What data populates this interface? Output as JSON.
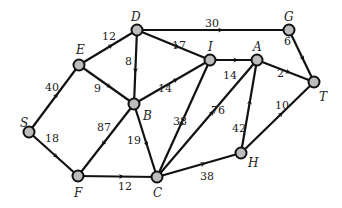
{
  "diagram": {
    "type": "directed-weighted-network",
    "nodes": [
      {
        "id": "S",
        "label": "S",
        "x": 29,
        "y": 132,
        "lx": 20,
        "ly": 127
      },
      {
        "id": "E",
        "label": "E",
        "x": 79,
        "y": 65,
        "lx": 76,
        "ly": 54
      },
      {
        "id": "D",
        "label": "D",
        "x": 137,
        "y": 30,
        "lx": 131,
        "ly": 21
      },
      {
        "id": "G",
        "label": "G",
        "x": 289,
        "y": 30,
        "lx": 284,
        "ly": 21
      },
      {
        "id": "B",
        "label": "B",
        "x": 134,
        "y": 104,
        "lx": 143,
        "ly": 120
      },
      {
        "id": "I",
        "label": "I",
        "x": 210,
        "y": 60,
        "lx": 208,
        "ly": 51
      },
      {
        "id": "A",
        "label": "A",
        "x": 257,
        "y": 60,
        "lx": 253,
        "ly": 51
      },
      {
        "id": "T",
        "label": "T",
        "x": 314,
        "y": 82,
        "lx": 319,
        "ly": 101
      },
      {
        "id": "F",
        "label": "F",
        "x": 78,
        "y": 176,
        "lx": 74,
        "ly": 197
      },
      {
        "id": "C",
        "label": "C",
        "x": 157,
        "y": 177,
        "lx": 153,
        "ly": 197
      },
      {
        "id": "H",
        "label": "H",
        "x": 241,
        "y": 153,
        "lx": 248,
        "ly": 167
      }
    ],
    "edges": [
      {
        "from": "S",
        "to": "E",
        "weight": "40",
        "lx": 45,
        "ly": 91
      },
      {
        "from": "S",
        "to": "F",
        "weight": "18",
        "lx": 45,
        "ly": 142
      },
      {
        "from": "E",
        "to": "D",
        "weight": "12",
        "lx": 102,
        "ly": 40
      },
      {
        "from": "E",
        "to": "B",
        "weight": "9",
        "lx": 94,
        "ly": 92
      },
      {
        "from": "D",
        "to": "G",
        "weight": "30",
        "lx": 205,
        "ly": 27
      },
      {
        "from": "D",
        "to": "B",
        "weight": "8",
        "lx": 125,
        "ly": 65
      },
      {
        "from": "D",
        "to": "I",
        "weight": "17",
        "lx": 172,
        "ly": 49
      },
      {
        "from": "G",
        "to": "T",
        "weight": "6",
        "lx": 284,
        "ly": 45
      },
      {
        "from": "B",
        "to": "I",
        "weight": "14",
        "lx": 158,
        "ly": 92
      },
      {
        "from": "B",
        "to": "F",
        "weight": "87",
        "lx": 97,
        "ly": 131
      },
      {
        "from": "B",
        "to": "C",
        "weight": "19",
        "lx": 127,
        "ly": 144
      },
      {
        "from": "I",
        "to": "A",
        "weight": "14",
        "lx": 223,
        "ly": 79
      },
      {
        "from": "I",
        "to": "C",
        "weight": "38",
        "lx": 173,
        "ly": 125
      },
      {
        "from": "A",
        "to": "T",
        "weight": "2",
        "lx": 277,
        "ly": 77
      },
      {
        "from": "C",
        "to": "A",
        "weight": "76",
        "lx": 211,
        "ly": 114
      },
      {
        "from": "F",
        "to": "C",
        "weight": "12",
        "lx": 118,
        "ly": 190
      },
      {
        "from": "C",
        "to": "H",
        "weight": "38",
        "lx": 200,
        "ly": 180
      },
      {
        "from": "H",
        "to": "A",
        "weight": "42",
        "lx": 232,
        "ly": 132
      },
      {
        "from": "H",
        "to": "T",
        "weight": "10",
        "lx": 275,
        "ly": 109
      }
    ]
  },
  "colors": {
    "node_fill": "#bdbdbd",
    "stroke": "#111111",
    "background": "#ffffff"
  }
}
